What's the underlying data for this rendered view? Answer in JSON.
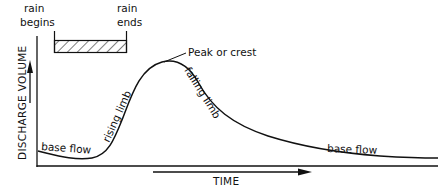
{
  "diagram": {
    "type": "hydrograph",
    "colors": {
      "ink": "#111111",
      "background": "#ffffff"
    },
    "rain": {
      "begins_line1": "rain",
      "begins_line2": "begins",
      "ends_line1": "rain",
      "ends_line2": "ends"
    },
    "annotations": {
      "peak": "Peak or crest",
      "rising_limb": "rising limb",
      "falling_limb": "falling limb",
      "base_flow_left": "base flow",
      "base_flow_right": "base flow"
    },
    "axes": {
      "y_label": "DISCHARGE VOLUME",
      "x_label": "TIME"
    }
  }
}
